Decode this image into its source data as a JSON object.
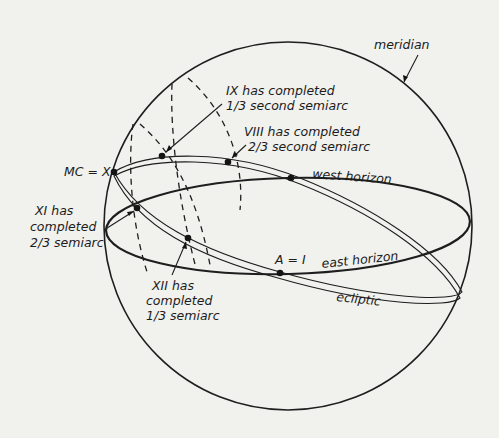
{
  "labels": {
    "meridian": "meridian",
    "ix_line1": "IX has completed",
    "ix_line2": "1/3 second semiarc",
    "viii_line1": "VIII has completed",
    "viii_line2": "2/3 second semiarc",
    "mc": "MC = X",
    "west_horizon": "west horizon",
    "xi_line1": "XI has",
    "xi_line2": "completed",
    "xi_line3": "2/3 semiarc",
    "asc": "A = I",
    "east_horizon": "east horizon",
    "xii_line1": "XII has",
    "xii_line2": "completed",
    "xii_line3": "1/3 semiarc",
    "ecliptic": "ecliptic"
  },
  "colors": {
    "background": "#f1f1ee",
    "ink": "#1e1e1e"
  }
}
